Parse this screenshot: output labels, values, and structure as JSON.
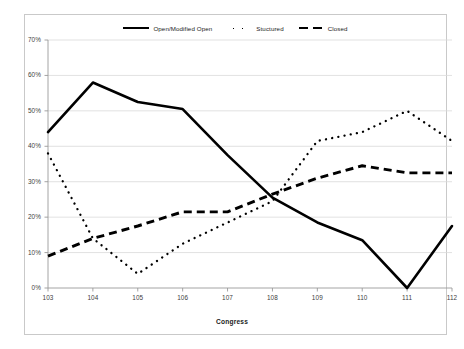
{
  "chart_data": {
    "type": "line",
    "title": "",
    "xlabel": "Congress",
    "ylabel": "",
    "categories": [
      "103",
      "104",
      "105",
      "106",
      "107",
      "108",
      "109",
      "110",
      "111",
      "112"
    ],
    "ylim": [
      0,
      70
    ],
    "ytick_labels": [
      "0%",
      "10%",
      "20%",
      "30%",
      "40%",
      "50%",
      "60%",
      "70%"
    ],
    "ytick_values": [
      0,
      10,
      20,
      30,
      40,
      50,
      60,
      70
    ],
    "grid": "horizontal",
    "legend_position": "top-center",
    "series": [
      {
        "name": "Open/Modified Open",
        "style": "solid",
        "color": "#000000",
        "values": [
          44,
          58,
          52.5,
          50.5,
          37.5,
          25.5,
          18.5,
          13.5,
          0,
          17.5
        ]
      },
      {
        "name": "Stuctured",
        "style": "dotted",
        "color": "#000000",
        "values": [
          38,
          14,
          4,
          12.5,
          18.5,
          24.5,
          41.5,
          44,
          50,
          41.5
        ]
      },
      {
        "name": "Closed",
        "style": "dashed",
        "color": "#000000",
        "values": [
          9,
          14,
          17.5,
          21.5,
          21.5,
          26.5,
          31,
          34.5,
          32.5,
          32.5
        ]
      }
    ]
  },
  "legend": {
    "entries": [
      {
        "label": "Open/Modified Open",
        "icon": "solid-line-swatch"
      },
      {
        "label": "Stuctured",
        "icon": "dotted-line-swatch"
      },
      {
        "label": "Closed",
        "icon": "dashed-line-swatch"
      }
    ]
  },
  "axes": {
    "x_title": "Congress"
  },
  "colors": {
    "frame": "#c9c9c9",
    "gridline": "#d9d9d9",
    "axis": "#9a9a9a",
    "series": "#000000",
    "tick_text": "#404040"
  }
}
